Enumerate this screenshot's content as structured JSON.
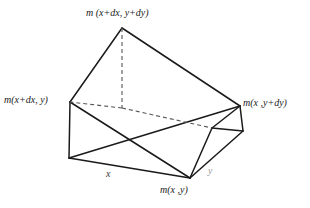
{
  "figure": {
    "title_label_top": "m (x+dx, y+dy)",
    "label_left": "m(x+dx, y)",
    "label_right": "m(x ,y+dy)",
    "label_bottom": "m(x ,y)",
    "axis_label_x": "x",
    "axis_label_y": "y",
    "colors": {
      "background": "#ffffff",
      "stroke": "#1a1a1a",
      "hidden_stroke": "#555555",
      "text": "#1a1a1a",
      "axis_text_faint": "#9a9a9a"
    },
    "geometry": {
      "description": "oblique parallelepiped cell with apex and hidden back edges",
      "vertices": {
        "apex_top": [
          122,
          28
        ],
        "left": [
          70,
          102
        ],
        "right": [
          240,
          106
        ],
        "back_hidden": [
          122,
          108
        ],
        "bottom_left": [
          69,
          158
        ],
        "bottom_front": [
          190,
          178
        ],
        "right_lower": [
          243,
          131
        ],
        "back_lower_right": [
          212,
          128
        ]
      },
      "solid_edges": [
        [
          [
            122,
            28
          ],
          [
            70,
            102
          ]
        ],
        [
          [
            122,
            28
          ],
          [
            240,
            106
          ]
        ],
        [
          [
            70,
            102
          ],
          [
            69,
            158
          ]
        ],
        [
          [
            240,
            106
          ],
          [
            243,
            131
          ]
        ],
        [
          [
            69,
            158
          ],
          [
            190,
            178
          ]
        ],
        [
          [
            190,
            178
          ],
          [
            243,
            131
          ]
        ],
        [
          [
            70,
            102
          ],
          [
            190,
            178
          ]
        ],
        [
          [
            69,
            158
          ],
          [
            240,
            106
          ]
        ],
        [
          [
            190,
            178
          ],
          [
            212,
            128
          ]
        ],
        [
          [
            212,
            128
          ],
          [
            243,
            131
          ]
        ],
        [
          [
            240,
            106
          ],
          [
            212,
            128
          ]
        ]
      ],
      "dashed_edges": [
        [
          [
            122,
            28
          ],
          [
            122,
            108
          ]
        ],
        [
          [
            122,
            108
          ],
          [
            70,
            102
          ]
        ],
        [
          [
            122,
            108
          ],
          [
            212,
            128
          ]
        ]
      ]
    }
  }
}
